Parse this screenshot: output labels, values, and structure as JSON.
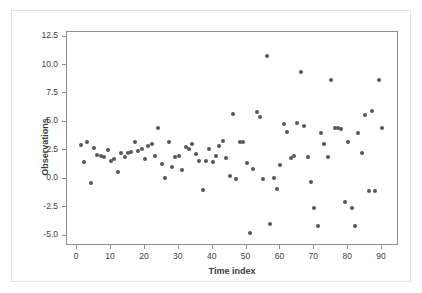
{
  "chart_data": {
    "type": "scatter",
    "title": "",
    "xlabel": "Time index",
    "ylabel": "Observations",
    "xlim": [
      -3,
      95
    ],
    "ylim": [
      -5.9,
      12.9
    ],
    "grid": false,
    "legend": null,
    "marker": {
      "color": "#555759",
      "shape": "circle",
      "size": 4
    },
    "xticks": [
      0,
      10,
      20,
      30,
      40,
      50,
      60,
      70,
      80,
      90
    ],
    "xtick_labels": [
      "0",
      "10",
      "20",
      "30",
      "40",
      "50",
      "60",
      "70",
      "80",
      "90"
    ],
    "yticks": [
      -5.0,
      -2.5,
      0.0,
      2.5,
      5.0,
      7.5,
      10.0,
      12.5
    ],
    "ytick_labels": [
      "-5.0",
      "-2.5",
      "0.0",
      "2.5",
      "5.0",
      "7.5",
      "10.0",
      "12.5"
    ],
    "series": [
      {
        "name": "Observations",
        "x": [
          1,
          2,
          3,
          4,
          5,
          6,
          7,
          8,
          9,
          10,
          11,
          12,
          13,
          14,
          15,
          16,
          17,
          18,
          19,
          20,
          21,
          22,
          23,
          24,
          25,
          26,
          27,
          28,
          29,
          30,
          31,
          32,
          33,
          34,
          35,
          36,
          37,
          38,
          39,
          40,
          41,
          42,
          43,
          44,
          45,
          46,
          47,
          48,
          49,
          50,
          51,
          52,
          53,
          54,
          55,
          56,
          57,
          58,
          59,
          60,
          61,
          62,
          63,
          64,
          65,
          66,
          67,
          68,
          69,
          70,
          71,
          72,
          73,
          74,
          75,
          76,
          77,
          78,
          79,
          80,
          81,
          82,
          83,
          84,
          85,
          86,
          87,
          88,
          89,
          90
        ],
        "y": [
          3.0,
          1.5,
          3.2,
          -0.35,
          2.7,
          2.1,
          2.05,
          1.9,
          2.5,
          1.6,
          1.7,
          0.6,
          2.25,
          1.9,
          2.3,
          2.4,
          3.2,
          2.45,
          2.65,
          1.7,
          2.9,
          3.1,
          2.0,
          4.45,
          1.3,
          0.1,
          3.2,
          1.05,
          1.9,
          2.0,
          0.75,
          2.8,
          2.65,
          3.05,
          2.2,
          1.6,
          -1.0,
          1.55,
          2.6,
          1.5,
          2.0,
          2.85,
          3.3,
          1.8,
          0.25,
          5.7,
          -0.05,
          3.2,
          3.2,
          1.4,
          -4.8,
          0.9,
          5.9,
          5.4,
          -0.05,
          10.8,
          -4.0,
          0.05,
          -0.85,
          1.2,
          4.8,
          4.15,
          1.85,
          2.0,
          4.9,
          9.4,
          4.6,
          1.9,
          -0.3,
          -2.55,
          -4.15,
          4.0,
          3.1,
          1.9,
          8.65,
          4.45,
          4.45,
          4.4,
          -2.05,
          3.25,
          -2.6,
          -4.15,
          4.05,
          2.25,
          5.6,
          -1.1,
          6.0,
          -1.05,
          8.65,
          4.45
        ]
      }
    ]
  }
}
